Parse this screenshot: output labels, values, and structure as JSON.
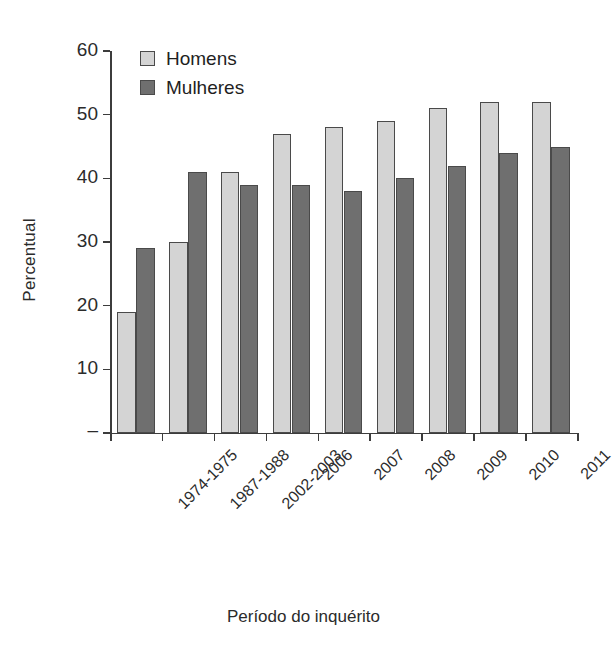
{
  "chart_data": {
    "type": "bar",
    "title": "",
    "xlabel": "Período do inquérito",
    "ylabel": "Percentual",
    "categories": [
      "1974-1975",
      "1987-1988",
      "2002-2003",
      "2006",
      "2007",
      "2008",
      "2009",
      "2010",
      "2011"
    ],
    "series": [
      {
        "name": "Homens",
        "color": "#d4d4d4",
        "values": [
          19,
          30,
          41,
          47,
          48,
          49,
          51,
          52,
          52
        ]
      },
      {
        "name": "Mulheres",
        "color": "#6f6f6f",
        "values": [
          29,
          41,
          39,
          39,
          38,
          40,
          42,
          44,
          45
        ]
      }
    ],
    "ylim": [
      0,
      60
    ],
    "yticks": [
      0,
      10,
      20,
      30,
      40,
      50,
      60
    ],
    "ytick_labels": [
      "–",
      "10",
      "20",
      "30",
      "40",
      "50",
      "60"
    ],
    "grid": false,
    "legend_position": "top-left"
  },
  "axes": {
    "y_title": "Percentual",
    "x_title": "Período do inquérito"
  },
  "legend": {
    "items": [
      {
        "label": "Homens"
      },
      {
        "label": "Mulheres"
      }
    ]
  }
}
